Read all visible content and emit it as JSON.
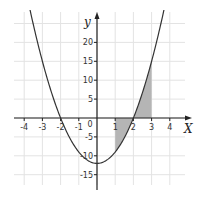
{
  "chart_data": {
    "type": "line",
    "title": "",
    "function": "y = 3x^2 - 12",
    "xlabel": "X",
    "ylabel": "y",
    "xlim": [
      -4.3,
      4.6
    ],
    "ylim": [
      -17,
      27
    ],
    "grid": true,
    "x_ticks": [
      -4,
      -3,
      -2,
      -1,
      0,
      1,
      2,
      3,
      4
    ],
    "x_tick_labels": [
      "-4",
      "-3",
      "-2",
      "-1",
      "0",
      "1",
      "2",
      "3",
      "4"
    ],
    "y_ticks": [
      -15,
      -10,
      -5,
      5,
      10,
      15,
      20
    ],
    "y_tick_labels": [
      "-15",
      "-10",
      "-5",
      "5",
      "10",
      "15",
      "20"
    ],
    "series": [
      {
        "name": "parabola",
        "x": [
          -3.7,
          -3,
          -2,
          -1,
          0,
          1,
          2,
          3,
          3.7
        ],
        "y": [
          29.07,
          15,
          0,
          -9,
          -12,
          -9,
          0,
          15,
          29.07
        ]
      }
    ],
    "shaded_region": {
      "from_x": 1,
      "to_x": 3,
      "description": "Area between curve and x-axis from x=1 to x=3",
      "color": "#b5b5b5"
    },
    "roots": [
      -2,
      2
    ],
    "vertex": [
      0,
      -12
    ],
    "colors": {
      "curve": "#333333",
      "axes": "#222222",
      "grid": "#e3e3e3",
      "shade": "#b5b5b5"
    }
  }
}
